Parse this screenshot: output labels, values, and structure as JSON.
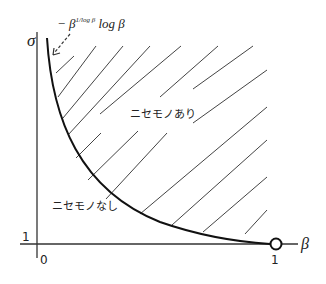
{
  "diagram": {
    "axes": {
      "y_label": "σ",
      "x_label": "β",
      "origin_label": "0",
      "y_tick_label": "1",
      "x_tick_label": "1"
    },
    "curve_label": {
      "prefix": "− β",
      "superscript": "1/log β",
      "suffix": " log β"
    },
    "regions": {
      "shaded": "ニセモノあり",
      "unshaded": "ニセモノなし"
    },
    "colors": {
      "line": "#111111",
      "hatch": "#444444",
      "background": "#ffffff"
    }
  }
}
